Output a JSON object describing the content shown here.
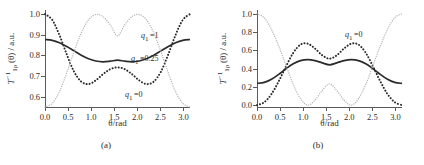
{
  "figure": {
    "panels": [
      {
        "caption": "(a)",
        "xlabel": "θ/rad",
        "ylabel_parts": {
          "T": "T",
          "sup": "−1",
          "sub": "1ρ",
          "arg": "(θ) / a.u."
        },
        "xticks": [
          "0.0",
          "0.5",
          "1.0",
          "1.5",
          "2.0",
          "2.5",
          "3.0"
        ],
        "xtick_values": [
          0.0,
          0.5,
          1.0,
          1.5,
          2.0,
          2.5,
          3.0
        ],
        "yticks": [
          "0.6",
          "0.7",
          "0.8",
          "0.9",
          "1.0"
        ],
        "ytick_values": [
          0.6,
          0.7,
          0.8,
          0.9,
          1.0
        ],
        "xlim": [
          0.0,
          3.1416
        ],
        "ylim": [
          0.55,
          1.02
        ],
        "curve_labels": [
          {
            "text": "q₁ =1",
            "x": 96,
            "y": 21
          },
          {
            "text": "q₁ =0.25",
            "x": 86,
            "y": 44
          },
          {
            "text": "q₁ =0",
            "x": 80,
            "y": 80
          }
        ]
      },
      {
        "caption": "(b)",
        "xlabel": "θ/rad",
        "ylabel_parts": {
          "T": "T",
          "sup": "−1",
          "sub": "1ρ",
          "arg": "(θ) / a.u."
        },
        "xticks": [
          "0.0",
          "0.5",
          "1.0",
          "1.5",
          "2.0",
          "2.5",
          "3.0"
        ],
        "xtick_values": [
          0.0,
          0.5,
          1.0,
          1.5,
          2.0,
          2.5,
          3.0
        ],
        "yticks": [
          "0.0",
          "0.2",
          "0.4",
          "0.6",
          "0.8",
          "1.0"
        ],
        "ytick_values": [
          0.0,
          0.2,
          0.4,
          0.6,
          0.8,
          1.0
        ],
        "xlim": [
          0.0,
          3.1416
        ],
        "ylim": [
          -0.02,
          1.04
        ],
        "curve_labels": [
          {
            "text": "q₁ =0",
            "x": 88,
            "y": 20
          }
        ]
      }
    ]
  },
  "chart_data": [
    {
      "type": "line",
      "panel": "(a)",
      "title": "",
      "xlabel": "θ/rad",
      "ylabel": "T⁻¹₁ρ(θ) / a.u.",
      "xlim": [
        0.0,
        3.1416
      ],
      "ylim": [
        0.55,
        1.02
      ],
      "xticks": [
        0.0,
        0.5,
        1.0,
        1.5,
        2.0,
        2.5,
        3.0
      ],
      "yticks": [
        0.6,
        0.7,
        0.8,
        0.9,
        1.0
      ],
      "grid": false,
      "legend": "inline-annotations",
      "x": [
        0.0,
        0.1571,
        0.3142,
        0.4712,
        0.6283,
        0.7854,
        0.9425,
        1.0996,
        1.2566,
        1.4137,
        1.5708,
        1.7279,
        1.885,
        2.042,
        2.1991,
        2.3562,
        2.5133,
        2.6704,
        2.8274,
        2.9845,
        3.1416
      ],
      "series": [
        {
          "name": "q_1 = 0.25",
          "style": "solid",
          "color": "#2b2b2b",
          "values": [
            0.877,
            0.873,
            0.861,
            0.843,
            0.822,
            0.801,
            0.784,
            0.773,
            0.769,
            0.772,
            0.777,
            0.772,
            0.769,
            0.773,
            0.784,
            0.801,
            0.822,
            0.843,
            0.861,
            0.873,
            0.877
          ]
        },
        {
          "name": "q_1 = 0",
          "style": "dashed",
          "color": "#2b2b2b",
          "values": [
            1.0,
            0.972,
            0.898,
            0.805,
            0.722,
            0.673,
            0.661,
            0.679,
            0.709,
            0.733,
            0.742,
            0.733,
            0.709,
            0.679,
            0.661,
            0.673,
            0.722,
            0.805,
            0.898,
            0.972,
            1.0
          ]
        },
        {
          "name": "q_1 = 1",
          "style": "dotted",
          "color": "#b3b3b3",
          "values": [
            0.55,
            0.568,
            0.625,
            0.716,
            0.818,
            0.909,
            0.972,
            0.998,
            0.988,
            0.948,
            0.895,
            0.948,
            0.988,
            0.998,
            0.972,
            0.909,
            0.818,
            0.716,
            0.625,
            0.568,
            0.55
          ]
        }
      ]
    },
    {
      "type": "line",
      "panel": "(b)",
      "title": "",
      "xlabel": "θ/rad",
      "ylabel": "T⁻¹₁ρ(θ) / a.u.",
      "xlim": [
        0.0,
        3.1416
      ],
      "ylim": [
        -0.02,
        1.04
      ],
      "xticks": [
        0.0,
        0.5,
        1.0,
        1.5,
        2.0,
        2.5,
        3.0
      ],
      "yticks": [
        0.0,
        0.2,
        0.4,
        0.6,
        0.8,
        1.0
      ],
      "grid": false,
      "legend": "inline-annotations",
      "x": [
        0.0,
        0.1571,
        0.3142,
        0.4712,
        0.6283,
        0.7854,
        0.9425,
        1.0996,
        1.2566,
        1.4137,
        1.5708,
        1.7279,
        1.885,
        2.042,
        2.1991,
        2.3562,
        2.5133,
        2.6704,
        2.8274,
        2.9845,
        3.1416
      ],
      "series": [
        {
          "name": "solid-curve",
          "style": "solid",
          "color": "#2b2b2b",
          "values": [
            0.238,
            0.249,
            0.283,
            0.337,
            0.398,
            0.452,
            0.487,
            0.498,
            0.487,
            0.462,
            0.441,
            0.462,
            0.487,
            0.498,
            0.487,
            0.452,
            0.398,
            0.337,
            0.283,
            0.249,
            0.238
          ]
        },
        {
          "name": "q_1 = 0",
          "style": "dashed",
          "color": "#2b2b2b",
          "values": [
            0.0,
            0.032,
            0.122,
            0.262,
            0.424,
            0.572,
            0.662,
            0.672,
            0.619,
            0.545,
            0.508,
            0.545,
            0.619,
            0.672,
            0.662,
            0.572,
            0.424,
            0.262,
            0.122,
            0.032,
            0.0
          ]
        },
        {
          "name": "dotted-curve",
          "style": "dotted",
          "color": "#b3b3b3",
          "values": [
            1.0,
            0.956,
            0.828,
            0.646,
            0.436,
            0.226,
            0.07,
            0.0,
            0.055,
            0.16,
            0.233,
            0.16,
            0.055,
            0.0,
            0.07,
            0.226,
            0.436,
            0.646,
            0.828,
            0.956,
            1.0
          ]
        }
      ]
    }
  ]
}
